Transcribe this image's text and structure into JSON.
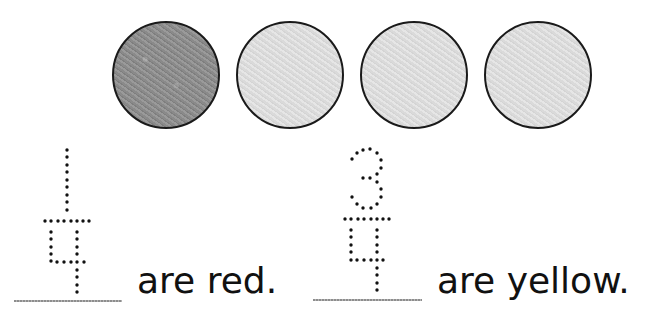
{
  "worksheet": {
    "circles": [
      {
        "color_name": "red",
        "fill": "#8c8c8c",
        "shade": "dark"
      },
      {
        "color_name": "yellow",
        "fill": "#dedede",
        "shade": "light"
      },
      {
        "color_name": "yellow",
        "fill": "#dedede",
        "shade": "light"
      },
      {
        "color_name": "yellow",
        "fill": "#dedede",
        "shade": "light"
      }
    ],
    "items": [
      {
        "numerator": "1",
        "denominator": "4",
        "text": "are red."
      },
      {
        "numerator": "3",
        "denominator": "4",
        "text": "are yellow."
      }
    ]
  }
}
